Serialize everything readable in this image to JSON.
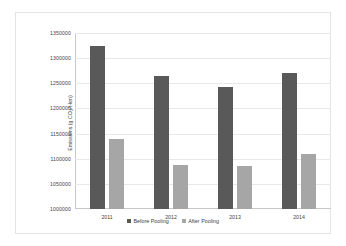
{
  "chart_data": {
    "type": "bar",
    "title": "",
    "xlabel": "",
    "ylabel": "Emissions (g CO₂/t-km)",
    "ylabel_prefix": "Emissions (g CO",
    "ylabel_sub": "2",
    "ylabel_suffix": "/t-km)",
    "categories": [
      "2011",
      "2012",
      "2013",
      "2014"
    ],
    "series": [
      {
        "name": "Before Pooling",
        "color": "#595959",
        "values": [
          1324000,
          1264000,
          1242000,
          1270000
        ]
      },
      {
        "name": "After Pooling",
        "color": "#a6a6a6",
        "values": [
          1139000,
          1088000,
          1086000,
          1110000
        ]
      }
    ],
    "ylim": [
      1000000,
      1350000
    ],
    "ytick_step": 50000,
    "yticks": [
      "1000000",
      "1050000",
      "1100000",
      "1150000",
      "1200000",
      "1250000",
      "1300000",
      "1350000"
    ],
    "grid": true,
    "legend_position": "bottom"
  }
}
